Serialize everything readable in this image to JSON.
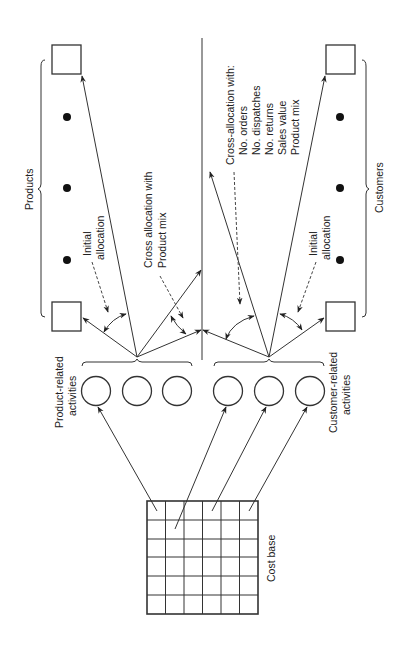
{
  "diagram": {
    "orientation": "rotated 90deg counter-clockwise (text reads bottom-to-top)",
    "labels": {
      "products": "Products",
      "customers": "Customers",
      "product_activities_line1": "Product-related",
      "product_activities_line2": "activities",
      "customer_activities_line1": "Customer-related",
      "customer_activities_line2": "activities",
      "cost_base": "Cost base",
      "initial_alloc_p_line1": "Initial",
      "initial_alloc_p_line2": "allocation",
      "initial_alloc_c_line1": "Initial",
      "initial_alloc_c_line2": "allocation",
      "cross_alloc_p_line1": "Cross allocation  with",
      "cross_alloc_p_line2": "Product mix",
      "cross_alloc_c_line1": "Cross-allocation with:",
      "cross_alloc_c_items": [
        "No. orders",
        "No. dispatches",
        "No. returns",
        "Sales value",
        "Product mix"
      ]
    },
    "nodes": {
      "cost_base_grid": {
        "rows": 6,
        "cols": 6
      },
      "product_activity_circles": 3,
      "customer_activity_circles": 3,
      "product_boxes": 2,
      "product_dots": 3,
      "customer_boxes": 2,
      "customer_dots": 3
    }
  }
}
